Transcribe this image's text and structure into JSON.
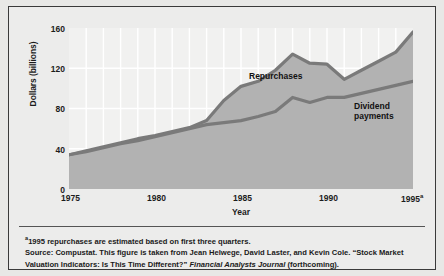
{
  "chart_data": {
    "type": "area",
    "title": "",
    "xlabel": "Year",
    "ylabel": "Dollars (billions)",
    "xlim": [
      1975,
      1995
    ],
    "ylim": [
      0,
      160
    ],
    "yticks": [
      0,
      40,
      80,
      120,
      160
    ],
    "xticks": [
      "1975",
      "1980",
      "1985",
      "1990",
      "1995"
    ],
    "xtick_superscript": "a",
    "grid": true,
    "legend_position": "inline-annotation",
    "x": [
      1975,
      1976,
      1977,
      1978,
      1979,
      1980,
      1981,
      1982,
      1983,
      1984,
      1985,
      1986,
      1987,
      1988,
      1989,
      1990,
      1991,
      1992,
      1993,
      1994,
      1995
    ],
    "series": [
      {
        "name": "Repurchases",
        "values": [
          34,
          38,
          42,
          46,
          50,
          53,
          57,
          61,
          68,
          88,
          102,
          107,
          118,
          134,
          125,
          124,
          109,
          118,
          127,
          136,
          156
        ]
      },
      {
        "name": "Dividend payments",
        "values": [
          34,
          37,
          41,
          45,
          48,
          52,
          56,
          60,
          64,
          66,
          68,
          72,
          77,
          91,
          86,
          91,
          91,
          95,
          99,
          103,
          107
        ]
      }
    ],
    "colors": {
      "line": "#7a7a7a",
      "fill": "#b2b2b2",
      "plot_background": "#f1f1f0",
      "gridline": "#ffffff",
      "figure_background": "#e8e8e6",
      "frame_border": "#3a3a3a",
      "text": "#1c1c1c"
    }
  },
  "labels": {
    "repurchases": "Repurchases",
    "dividend_line1": "Dividend",
    "dividend_line2": "payments",
    "y_axis_title": "Dollars (billions)",
    "x_axis_title": "Year"
  },
  "notes": {
    "line1_marker": "a",
    "line1": "1995 repurchases are estimated based on first three quarters.",
    "line2": "Source: Compustat. This figure is taken from Jean Helwege, David Laster, and Kevin Cole. “Stock Market",
    "line3_pre": "Valuation Indicators: Is This Time Different?” ",
    "line3_italic": "Financial Analysts Journal",
    "line3_post": " (forthcoming)."
  }
}
